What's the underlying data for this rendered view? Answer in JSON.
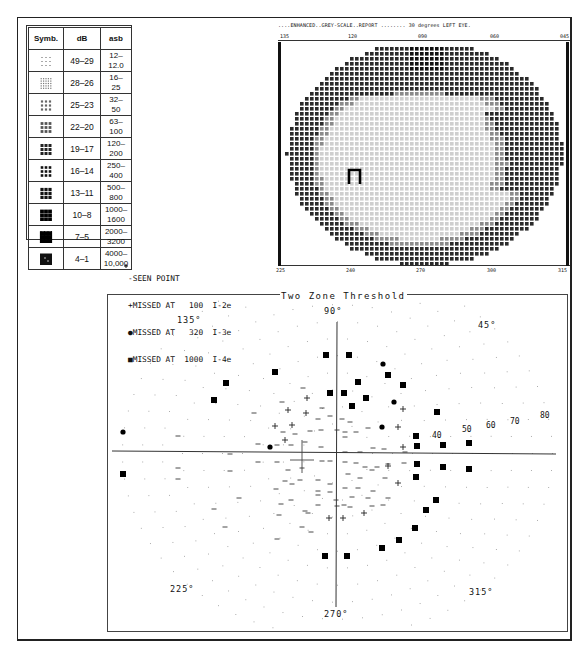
{
  "legend": {
    "headers": [
      "Symb.",
      "dB",
      "asb"
    ],
    "rows": [
      {
        "symbol": "sparse-dots",
        "db": "49–29",
        "asb": "12–12.0"
      },
      {
        "symbol": "fine-grid",
        "db": "28–26",
        "asb": "16–25"
      },
      {
        "symbol": "light-blocks",
        "db": "25–23",
        "asb": "32–50"
      },
      {
        "symbol": "medium-blocks",
        "db": "22–20",
        "asb": "63–100"
      },
      {
        "symbol": "dark-squares",
        "db": "19–17",
        "asb": "120–200"
      },
      {
        "symbol": "spaced-squares",
        "db": "16–14",
        "asb": "250–400"
      },
      {
        "symbol": "dense-squares",
        "db": "13–11",
        "asb": "500–800"
      },
      {
        "symbol": "solid-grid",
        "db": "10–8",
        "asb": "1000–1600"
      },
      {
        "symbol": "heavy-grid",
        "db": "7–5",
        "asb": "2000–3200"
      },
      {
        "symbol": "solid-black",
        "db": "4–1",
        "asb": "4000–10,000"
      }
    ]
  },
  "greyscale": {
    "header": "....ENHANCED..GREY-SCALE..REPORT ........  30 degrees   LEFT  EYE.",
    "top_ticks": [
      "135",
      "120",
      "090",
      "060",
      "045"
    ],
    "bottom_ticks": [
      "225",
      "240",
      "270",
      "300",
      "315"
    ]
  },
  "key": {
    "lines": [
      "-SEEN POINT",
      "+MISSED AT   100  I-2e",
      "●MISSED AT   320  I-3e",
      "■MISSED AT  1000  I-4e"
    ]
  },
  "chart_data": {
    "type": "scatter",
    "title": "Two Zone Threshold",
    "subtype": "polar visual field",
    "angle_labels": [
      "90°",
      "45°",
      "135°",
      "225°",
      "270°",
      "315°"
    ],
    "eccentricity_labels": [
      "40",
      "50",
      "60",
      "70",
      "80"
    ],
    "series": [
      {
        "name": "SEEN POINT",
        "marker": "-",
        "count": "many (central ~30°)"
      },
      {
        "name": "MISSED AT 100 I-2e",
        "marker": "+",
        "points_px": [
          [
            307,
            398
          ],
          [
            288,
            410
          ],
          [
            306,
            413
          ],
          [
            275,
            426
          ],
          [
            292,
            425
          ],
          [
            285,
            440
          ],
          [
            403,
            409
          ],
          [
            398,
            427
          ],
          [
            403,
            447
          ],
          [
            388,
            466
          ],
          [
            398,
            483
          ],
          [
            329,
            518
          ],
          [
            343,
            518
          ],
          [
            364,
            513
          ]
        ]
      },
      {
        "name": "MISSED AT 320 I-3e",
        "marker": "●",
        "points_px": [
          [
            383,
            364
          ],
          [
            394,
            402
          ],
          [
            382,
            427
          ],
          [
            270,
            447
          ],
          [
            123,
            432
          ]
        ]
      },
      {
        "name": "MISSED AT 1000 I-4e",
        "marker": "■",
        "points_px": [
          [
            326,
            355
          ],
          [
            349,
            355
          ],
          [
            275,
            372
          ],
          [
            226,
            383
          ],
          [
            214,
            400
          ],
          [
            330,
            393
          ],
          [
            344,
            393
          ],
          [
            358,
            382
          ],
          [
            366,
            398
          ],
          [
            352,
            406
          ],
          [
            388,
            375
          ],
          [
            403,
            385
          ],
          [
            437,
            412
          ],
          [
            416,
            436
          ],
          [
            417,
            446
          ],
          [
            443,
            445
          ],
          [
            469,
            443
          ],
          [
            417,
            464
          ],
          [
            443,
            467
          ],
          [
            469,
            469
          ],
          [
            416,
            477
          ],
          [
            436,
            500
          ],
          [
            426,
            510
          ],
          [
            415,
            528
          ],
          [
            399,
            540
          ],
          [
            382,
            548
          ],
          [
            325,
            556
          ],
          [
            347,
            556
          ],
          [
            123,
            474
          ]
        ]
      }
    ]
  }
}
